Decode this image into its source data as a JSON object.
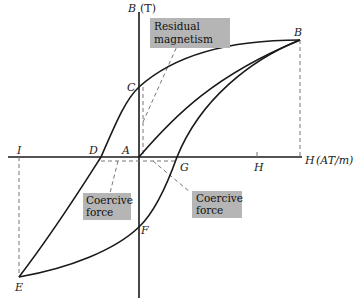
{
  "diagram": {
    "type": "hysteresis-loop",
    "axes": {
      "vertical": {
        "symbol": "B",
        "unit": "(T)"
      },
      "horizontal": {
        "symbol": "H",
        "unit": "(AT/m)"
      }
    },
    "points": {
      "A": "A",
      "B": "B",
      "C": "C",
      "D": "D",
      "E": "E",
      "F": "F",
      "G": "G",
      "H": "H",
      "I": "I"
    },
    "annotations": {
      "residual": {
        "line1": "Residual",
        "line2": "magnetism"
      },
      "coercive_left": {
        "line1": "Coercive",
        "line2": "force"
      },
      "coercive_right": {
        "line1": "Coercive",
        "line2": "force"
      }
    },
    "colors": {
      "curve": "#1a1a1a",
      "axis": "#1a1a1a",
      "dashed": "#777777",
      "label_box": "#b5b5b5"
    }
  }
}
